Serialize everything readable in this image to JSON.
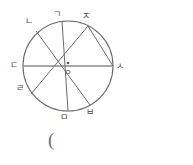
{
  "figure": {
    "type": "circle-geometry-diagram",
    "stroke_color": "#6b6b6b",
    "diameter_color": "#8a8a8a",
    "background_color": "#ffffff",
    "circle": {
      "center_x": 68,
      "center_y": 66,
      "radius": 45
    },
    "center_point": {
      "label": "ㅇ",
      "x": 68,
      "y": 66
    },
    "points": [
      {
        "id": "g",
        "label": "ㄱ",
        "x": 62,
        "y": 21,
        "label_x": 53,
        "label_y": 10
      },
      {
        "id": "n",
        "label": "ㄴ",
        "x": 36,
        "y": 31,
        "label_x": 25,
        "label_y": 17
      },
      {
        "id": "d",
        "label": "ㄷ",
        "x": 23,
        "y": 66,
        "label_x": 10,
        "label_y": 61
      },
      {
        "id": "r",
        "label": "ㄹ",
        "x": 31,
        "y": 94,
        "label_x": 16,
        "label_y": 84
      },
      {
        "id": "m",
        "label": "ㅁ",
        "x": 68,
        "y": 111,
        "label_x": 60,
        "label_y": 113
      },
      {
        "id": "b",
        "label": "ㅂ",
        "x": 90,
        "y": 105,
        "label_x": 86,
        "label_y": 108
      },
      {
        "id": "s",
        "label": "ㅅ",
        "x": 113,
        "y": 66,
        "label_x": 116,
        "label_y": 62
      },
      {
        "id": "j",
        "label": "ㅈ",
        "x": 88,
        "y": 26,
        "label_x": 82,
        "label_y": 12
      }
    ],
    "lines": [
      {
        "id": "diameter-d-s",
        "from": "d",
        "to": "s",
        "kind": "diameter",
        "color": "#8a8a8a"
      },
      {
        "id": "chord-n-b",
        "from": "n",
        "to": "b",
        "kind": "chord",
        "color": "#6b6b6b"
      },
      {
        "id": "chord-g-m",
        "from": "g",
        "to": "m",
        "kind": "chord",
        "color": "#6b6b6b"
      },
      {
        "id": "chord-r-j",
        "from": "r",
        "to": "j",
        "kind": "chord",
        "color": "#6b6b6b"
      },
      {
        "id": "chord-j-s",
        "from": "j",
        "to": "s",
        "kind": "chord",
        "color": "#6b6b6b"
      }
    ]
  },
  "caption": {
    "paren": "(",
    "x": 48,
    "y": 138
  }
}
